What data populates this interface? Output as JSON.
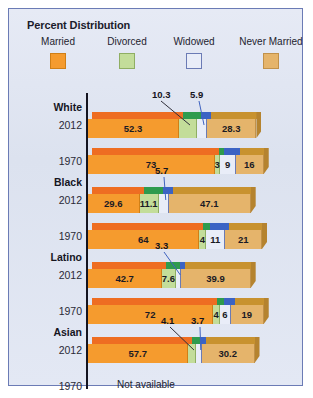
{
  "figure": {
    "title": "Percent Distribution",
    "border_color": "#6b7bb5",
    "background_color": "#dde3f0"
  },
  "legend": {
    "items": [
      {
        "label": "Married",
        "color": "#f59b2e",
        "border": "#d07f16",
        "key": "married"
      },
      {
        "label": "Divorced",
        "color": "#c3dd9a",
        "border": "#8fae63",
        "key": "divorced"
      },
      {
        "label": "Widowed",
        "color": "#e9edf8",
        "border": "#6b7bb5",
        "key": "widowed"
      },
      {
        "label": "Never Married",
        "color": "#e5b46b",
        "border": "#c1914a",
        "key": "never_married"
      }
    ]
  },
  "chart_data": {
    "type": "bar",
    "subtype": "stacked-horizontal-3d",
    "title": "Percent Distribution",
    "xlabel": "",
    "ylabel": "",
    "xlim": [
      0,
      100
    ],
    "grid": false,
    "legend_position": "top",
    "series": [
      {
        "name": "Married",
        "color": "#f59b2e"
      },
      {
        "name": "Divorced",
        "color": "#c3dd9a"
      },
      {
        "name": "Widowed",
        "color": "#e9edf8"
      },
      {
        "name": "Never Married",
        "color": "#e5b46b"
      }
    ],
    "groups": [
      {
        "label": "White",
        "rows": [
          {
            "year": "2012",
            "available": true,
            "values": [
              52.3,
              10.3,
              5.9,
              28.3
            ],
            "labels": [
              "52.3",
              "10.3",
              "5.9",
              "28.3"
            ],
            "inline": [
              true,
              false,
              false,
              true
            ]
          },
          {
            "year": "1970",
            "available": true,
            "values": [
              73,
              3,
              9,
              16
            ],
            "labels": [
              "73",
              "3",
              "9",
              "16"
            ],
            "inline": [
              true,
              true,
              true,
              true
            ]
          }
        ]
      },
      {
        "label": "Black",
        "rows": [
          {
            "year": "2012",
            "available": true,
            "values": [
              29.6,
              11.1,
              5.7,
              47.1
            ],
            "labels": [
              "29.6",
              "11.1",
              "5.7",
              "47.1"
            ],
            "inline": [
              true,
              true,
              false,
              true
            ]
          },
          {
            "year": "1970",
            "available": true,
            "values": [
              64,
              4,
              11,
              21
            ],
            "labels": [
              "64",
              "4",
              "11",
              "21"
            ],
            "inline": [
              true,
              true,
              true,
              true
            ]
          }
        ]
      },
      {
        "label": "Latino",
        "rows": [
          {
            "year": "2012",
            "available": true,
            "values": [
              42.7,
              7.6,
              3.3,
              39.9
            ],
            "labels": [
              "42.7",
              "7.6",
              "3.3",
              "39.9"
            ],
            "inline": [
              true,
              true,
              false,
              true
            ]
          },
          {
            "year": "1970",
            "available": true,
            "values": [
              72,
              4,
              6,
              19
            ],
            "labels": [
              "72",
              "4",
              "6",
              "19"
            ],
            "inline": [
              true,
              true,
              true,
              true
            ]
          }
        ]
      },
      {
        "label": "Asian",
        "rows": [
          {
            "year": "2012",
            "available": true,
            "values": [
              57.7,
              4.1,
              3.7,
              30.2
            ],
            "labels": [
              "57.7",
              "4.1",
              "3.7",
              "30.2"
            ],
            "inline": [
              true,
              false,
              false,
              true
            ]
          },
          {
            "year": "1970",
            "available": false,
            "values": [],
            "labels": [],
            "not_available_text": "Not available"
          }
        ]
      }
    ]
  }
}
